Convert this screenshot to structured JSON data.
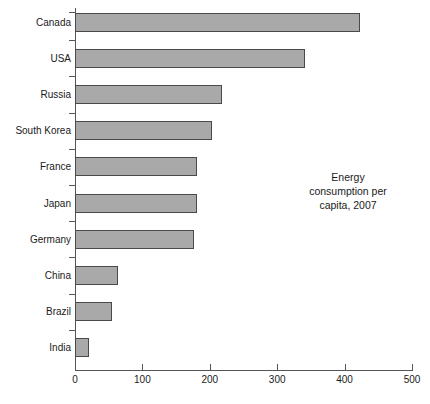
{
  "chart_data": {
    "type": "bar",
    "orientation": "horizontal",
    "title": "",
    "xlabel": "",
    "ylabel": "",
    "xlim": [
      0,
      500
    ],
    "xticks": [
      0,
      100,
      200,
      300,
      400,
      500
    ],
    "grid": false,
    "legend": null,
    "annotation": "Energy consumption per capita, 2007",
    "annotation_lines": [
      "Energy",
      "consumption per",
      "capita, 2007"
    ],
    "bar_color": "#a9a9a9",
    "bar_edge_color": "#4a4a4a",
    "categories": [
      "Canada",
      "USA",
      "Russia",
      "South Korea",
      "France",
      "Japan",
      "Germany",
      "China",
      "Brazil",
      "India"
    ],
    "values": [
      423,
      341,
      218,
      203,
      181,
      181,
      177,
      64,
      55,
      21
    ]
  }
}
